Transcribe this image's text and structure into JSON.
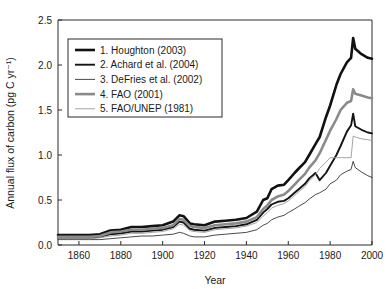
{
  "figure": {
    "background": "#ffffff",
    "width": 391,
    "height": 289
  },
  "axes": {
    "x_title": "Year",
    "y_title": "Annual flux of carbon (pg C yr⁻¹)",
    "x_ticks": [
      "1860",
      "1880",
      "1900",
      "1920",
      "1940",
      "1960",
      "1980",
      "2000"
    ],
    "y_ticks": [
      "0.0",
      "0.5",
      "1.0",
      "1.5",
      "2.0",
      "2.5"
    ]
  },
  "legend": {
    "items": [
      {
        "label": "1.  Houghton (2003)",
        "color": "#111111",
        "width": 2.6
      },
      {
        "label": "2.  Achard et al. (2004)",
        "color": "#141414",
        "width": 1.9
      },
      {
        "label": "3.  DeFries et al. (2002)",
        "color": "#1c1c1c",
        "width": 0.8
      },
      {
        "label": "4.  FAO (2001)",
        "color": "#8a8a8a",
        "width": 2.6
      },
      {
        "label": "5.  FAO/UNEP (1981)",
        "color": "#9a9a9a",
        "width": 0.9
      }
    ]
  },
  "chart_data": {
    "type": "line",
    "title": "",
    "xlabel": "Year",
    "ylabel": "Annual flux of carbon (pg C yr⁻¹)",
    "xlim": [
      1850,
      2000
    ],
    "ylim": [
      0.0,
      2.5
    ],
    "xticks": [
      1860,
      1880,
      1900,
      1920,
      1940,
      1960,
      1980,
      2000
    ],
    "yticks": [
      0.0,
      0.5,
      1.0,
      1.5,
      2.0,
      2.5
    ],
    "grid": false,
    "legend_position": "upper-left",
    "x": [
      1850,
      1855,
      1860,
      1865,
      1870,
      1875,
      1880,
      1885,
      1890,
      1895,
      1900,
      1905,
      1908,
      1910,
      1913,
      1915,
      1920,
      1925,
      1930,
      1935,
      1940,
      1945,
      1948,
      1950,
      1952,
      1955,
      1958,
      1960,
      1963,
      1965,
      1968,
      1970,
      1973,
      1975,
      1978,
      1980,
      1983,
      1985,
      1988,
      1990,
      1991,
      1992,
      1995,
      1998,
      2000
    ],
    "series": [
      {
        "name": "1.  Houghton (2003)",
        "color": "#111111",
        "linewidth": 2.6,
        "values": [
          0.11,
          0.11,
          0.11,
          0.11,
          0.12,
          0.16,
          0.17,
          0.2,
          0.2,
          0.21,
          0.22,
          0.26,
          0.33,
          0.32,
          0.24,
          0.23,
          0.22,
          0.26,
          0.27,
          0.28,
          0.3,
          0.37,
          0.5,
          0.52,
          0.62,
          0.66,
          0.67,
          0.72,
          0.8,
          0.85,
          0.92,
          1.0,
          1.12,
          1.2,
          1.42,
          1.55,
          1.78,
          1.9,
          2.03,
          2.08,
          2.3,
          2.18,
          2.12,
          2.08,
          2.07
        ]
      },
      {
        "name": "2.  Achard et al. (2004)",
        "color": "#141414",
        "linewidth": 1.9,
        "values": [
          0.08,
          0.08,
          0.08,
          0.08,
          0.09,
          0.12,
          0.13,
          0.15,
          0.15,
          0.16,
          0.17,
          0.2,
          0.26,
          0.25,
          0.18,
          0.17,
          0.16,
          0.19,
          0.2,
          0.21,
          0.23,
          0.28,
          0.36,
          0.4,
          0.45,
          0.48,
          0.49,
          0.52,
          0.58,
          0.62,
          0.68,
          0.74,
          0.8,
          0.72,
          0.8,
          0.88,
          1.0,
          1.1,
          1.26,
          1.33,
          1.46,
          1.32,
          1.28,
          1.25,
          1.24
        ]
      },
      {
        "name": "3.  DeFries et al. (2002)",
        "color": "#1c1c1c",
        "linewidth": 0.8,
        "values": [
          0.06,
          0.06,
          0.06,
          0.06,
          0.06,
          0.07,
          0.08,
          0.09,
          0.1,
          0.1,
          0.11,
          0.12,
          0.14,
          0.13,
          0.1,
          0.09,
          0.09,
          0.11,
          0.12,
          0.13,
          0.14,
          0.17,
          0.22,
          0.24,
          0.28,
          0.31,
          0.33,
          0.36,
          0.4,
          0.43,
          0.47,
          0.51,
          0.56,
          0.58,
          0.62,
          0.68,
          0.72,
          0.78,
          0.82,
          0.84,
          0.93,
          0.86,
          0.81,
          0.77,
          0.75
        ]
      },
      {
        "name": "4.  FAO (2001)",
        "color": "#8a8a8a",
        "linewidth": 2.6,
        "values": [
          0.09,
          0.09,
          0.09,
          0.09,
          0.1,
          0.14,
          0.15,
          0.17,
          0.17,
          0.18,
          0.19,
          0.22,
          0.29,
          0.28,
          0.21,
          0.2,
          0.19,
          0.22,
          0.23,
          0.24,
          0.26,
          0.31,
          0.4,
          0.44,
          0.5,
          0.54,
          0.56,
          0.6,
          0.67,
          0.72,
          0.79,
          0.86,
          0.94,
          1.02,
          1.17,
          1.27,
          1.4,
          1.5,
          1.58,
          1.6,
          1.73,
          1.68,
          1.66,
          1.64,
          1.63
        ]
      },
      {
        "name": "5.  FAO/UNEP (1981)",
        "color": "#9a9a9a",
        "linewidth": 0.9,
        "values": [
          0.07,
          0.07,
          0.07,
          0.07,
          0.08,
          0.1,
          0.11,
          0.13,
          0.13,
          0.14,
          0.15,
          0.18,
          0.23,
          0.22,
          0.16,
          0.15,
          0.14,
          0.17,
          0.18,
          0.19,
          0.21,
          0.25,
          0.32,
          0.36,
          0.41,
          0.44,
          0.46,
          0.49,
          0.55,
          0.59,
          0.65,
          0.71,
          0.78,
          0.85,
          0.92,
          0.97,
          0.97,
          0.97,
          0.97,
          0.97,
          1.21,
          1.2,
          1.18,
          1.17,
          1.16
        ]
      }
    ]
  }
}
